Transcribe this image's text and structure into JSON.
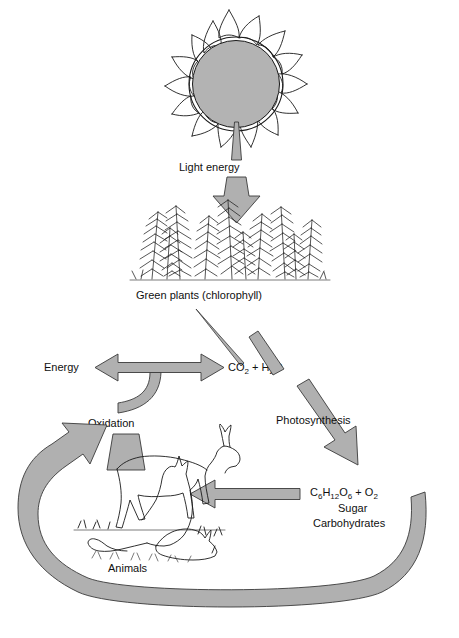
{
  "diagram": {
    "background_color": "#ffffff",
    "arrow_fill": "#b0b0b0",
    "arrow_stroke": "#3a3a3a",
    "line_color": "#1a1a1a",
    "sun_fill": "#b3b3b3"
  },
  "nodes": {
    "sun": {
      "name": "sun",
      "icon": "sun-icon"
    },
    "plants": {
      "label": "Green plants (chlorophyll)",
      "icon": "plants-icon"
    },
    "animals": {
      "label": "Animals",
      "icon": "animals-icon"
    },
    "reactants": {
      "formula": "CO",
      "formula_sub1": "2",
      "formula_mid": " + H",
      "formula_sub2": "2",
      "formula_end": "O",
      "plain": "CO2 + H2O"
    },
    "products": {
      "formula_c": "C",
      "formula_c_sub": "6",
      "formula_h": "H",
      "formula_h_sub": "12",
      "formula_o": "O",
      "formula_o_sub": "6",
      "formula_plus": " + O",
      "formula_o2_sub": "2",
      "plain": "C6H12O6 + O2",
      "line2": "Sugar",
      "line3": "Carbohydrates"
    },
    "energy": {
      "label": "Energy"
    }
  },
  "arrows": {
    "light_energy": {
      "label": "Light energy",
      "direction": "down"
    },
    "photosynthesis": {
      "label": "Photosynthesis",
      "direction": "down-right"
    },
    "oxidation": {
      "label": "Oxidation",
      "direction": "up"
    },
    "sugar_to_animals": {
      "label": "",
      "direction": "left"
    },
    "energy_out": {
      "label": "",
      "direction": "left"
    },
    "recycle_loop": {
      "label": "",
      "direction": "counter-clockwise"
    },
    "plants_to_co2": {
      "label": "",
      "direction": "down-right"
    }
  }
}
